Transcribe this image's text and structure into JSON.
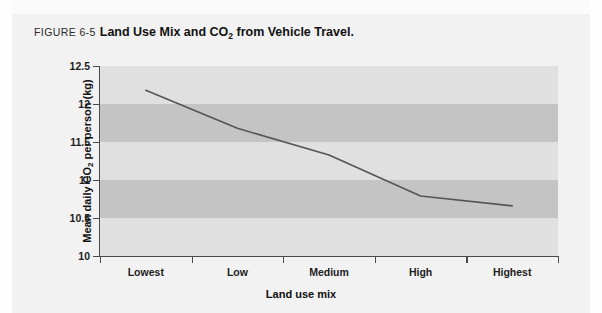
{
  "figure": {
    "number_label": "FIGURE 6-5",
    "caption_before_sub": "Land Use Mix and CO",
    "caption_sub": "2",
    "caption_after_sub": " from Vehicle Travel.",
    "background_color": "#f2f2f2",
    "page_margin_color": "#fdfdfd"
  },
  "chart_data": {
    "type": "line",
    "title": "Land Use Mix and CO2 from Vehicle Travel.",
    "xlabel": "Land use mix",
    "ylabel": "Mean daily CO2 per person (kg)",
    "ylabel_before_sub": "Mean daily CO",
    "ylabel_sub": "2",
    "ylabel_after_sub": " per person (kg)",
    "categories": [
      "Lowest",
      "Low",
      "Medium",
      "High",
      "Highest"
    ],
    "values": [
      12.18,
      11.68,
      11.33,
      10.79,
      10.66
    ],
    "series": [
      {
        "name": "Mean daily CO2 per person (kg)",
        "values": [
          12.18,
          11.68,
          11.33,
          10.79,
          10.66
        ]
      }
    ],
    "ylim": [
      10,
      12.5
    ],
    "ytick_labels": [
      "12.5",
      "12",
      "11.5",
      "11",
      "10.5",
      "10"
    ],
    "ytick_values": [
      12.5,
      12,
      11.5,
      11,
      10.5,
      10
    ],
    "grid": false,
    "banded_background": true,
    "band_colors": [
      "#e0e0e0",
      "#c4c4c4"
    ],
    "legend": "none",
    "line_color": "#555555",
    "axis_color": "#4a4a4a"
  }
}
